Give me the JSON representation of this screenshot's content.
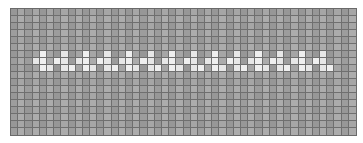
{
  "figure": {
    "kind": "stitch-pattern-grid",
    "grid": {
      "columns": 48,
      "rows": 18,
      "cell_width_px": 7.23,
      "cell_height_px": 7.11,
      "legend": {
        "g": "gray background cell",
        "w": "white pattern cell"
      },
      "pattern_rows": [
        "gggggggggggggggggggggggggggggggggggggggggggggggg",
        "gggggggggggggggggggggggggggggggggggggggggggggggg",
        "gggggggggggggggggggggggggggggggggggggggggggggggg",
        "gggggggggggggggggggggggggggggggggggggggggggggggg",
        "gggggggggggggggggggggggggggggggggggggggggggggggg",
        "gggggggggggggggggggggggggggggggggggggggggggggggg",
        "ggggwggwggwggwggwggwggwggwggwggwggwggwggwggwgggg",
        "gggwwgwwgwwgwwgwwgwwgwwgwwgwwgwwgwwgwwgwwgwwgggg",
        "ggggwwgwwgwwgwwgwwgwwgwwgwwgwwgwwgwwgwwgwwgwwggg",
        "gggggggggggggggggggggggggggggggggggggggggggggggg",
        "gggggggggggggggggggggggggggggggggggggggggggggggg",
        "gggggggggggggggggggggggggggggggggggggggggggggggg",
        "gggggggggggggggggggggggggggggggggggggggggggggggg",
        "gggggggggggggggggggggggggggggggggggggggggggggggg",
        "gggggggggggggggggggggggggggggggggggggggggggggggg",
        "gggggggggggggggggggggggggggggggggggggggggggggggg",
        "gggggggggggggggggggggggggggggggggggggggggggggggg",
        "gggggggggggggggggggggggggggggggggggggggggggggggg"
      ]
    },
    "colors": {
      "margin_background": "#ffffff",
      "grid_line": "#6f6f6f",
      "outer_border": "#6a6a6a",
      "gray_cell_tints": [
        "#979797",
        "#a6a6a6",
        "#9d9d9d",
        "#acacac"
      ],
      "white_cell": "#efefef",
      "white_cell_alt": "#e7e7e7"
    }
  }
}
